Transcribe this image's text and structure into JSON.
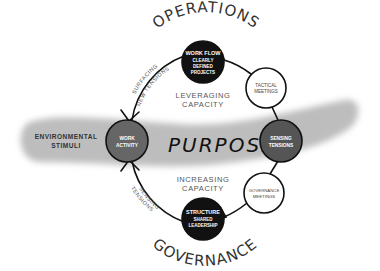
{
  "diagram": {
    "top_label": "OPERATIONS",
    "bottom_label": "GOVERNANCE",
    "center_label": "PURPOSE",
    "environment": {
      "line1": "ENVIRONMENTAL",
      "line2": "STIMULI"
    },
    "nodes": {
      "work_flow": {
        "title": "WORK FLOW",
        "line2": "CLEARLY",
        "line3": "DEFINED",
        "line4": "PROJECTS",
        "fill": "#111111"
      },
      "tactical_meetings": {
        "line1": "TACTICAL",
        "line2": "MEETINGS",
        "fill": "#ffffff"
      },
      "sensing_tensions": {
        "line1": "SENSING",
        "line2": "TENSIONS",
        "fill": "#555555"
      },
      "governance_meetings": {
        "line1": "GOVERNANCE",
        "line2": "MEETINGS",
        "fill": "#ffffff"
      },
      "structure": {
        "title": "STRUCTURE",
        "line2": "SHARED",
        "line3": "LEADERSHIP",
        "fill": "#111111"
      },
      "work_activity": {
        "line1": "WORK",
        "line2": "ACTIVITY",
        "fill": "#666666"
      }
    },
    "captions": {
      "leveraging": {
        "line1": "LEVERAGING",
        "line2": "CAPACITY"
      },
      "increasing": {
        "line1": "INCREASING",
        "line2": "CAPACITY"
      }
    },
    "arc_labels": {
      "upper_left": {
        "line1": "SURFACING",
        "line2": "NEW TENSIONS"
      },
      "lower_left": {
        "line1": "SENSING",
        "line2": "TENSIONS"
      }
    },
    "colors": {
      "band": "#bdbdbd",
      "stroke": "#111111"
    }
  }
}
